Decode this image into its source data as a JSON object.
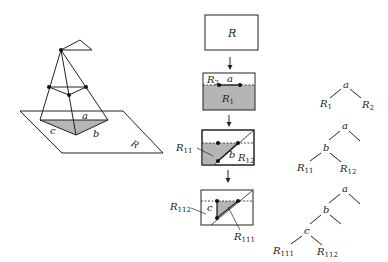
{
  "diagram": {
    "type": "BSP region subdivision illustration",
    "colors": {
      "line": "#222222",
      "shade": "#b5b5b5",
      "background": "#ffffff"
    },
    "perspective_view": {
      "edge_labels": {
        "a": "a",
        "b": "b",
        "c": "c"
      },
      "plane_label": "R"
    },
    "region_steps": [
      {
        "region": "R"
      },
      {
        "top_label": "R",
        "top_sub": "2",
        "edge_label": "a",
        "bottom_label": "R",
        "bottom_sub": "1"
      },
      {
        "left_label": "R",
        "left_sub": "11",
        "edge_label": "b",
        "right_label": "R",
        "right_sub": "12"
      },
      {
        "left_label": "R",
        "left_sub": "112",
        "edge_label": "c",
        "bottom_label": "R",
        "bottom_sub": "111"
      }
    ],
    "trees": [
      {
        "root": "a",
        "leaves": [
          {
            "l": "R",
            "s": "1"
          },
          {
            "l": "R",
            "s": "2"
          }
        ]
      },
      {
        "root": "a",
        "child": "b",
        "leaves": [
          {
            "l": "R",
            "s": "11"
          },
          {
            "l": "R",
            "s": "12"
          }
        ]
      },
      {
        "root": "a",
        "child": "b",
        "grandchild": "c",
        "leaves": [
          {
            "l": "R",
            "s": "111"
          },
          {
            "l": "R",
            "s": "112"
          }
        ]
      }
    ]
  }
}
